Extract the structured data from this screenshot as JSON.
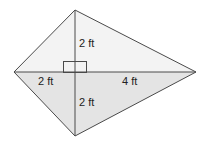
{
  "diagram": {
    "shape": "kite",
    "labels": {
      "top_segment": "2 ft",
      "left_segment": "2 ft",
      "right_segment": "4 ft",
      "bottom_segment": "2 ft"
    },
    "colors": {
      "upper_fill": "#f3f3f3",
      "lower_fill": "#e4e4e4",
      "stroke": "#4a4a4a",
      "background": "#ffffff"
    }
  }
}
